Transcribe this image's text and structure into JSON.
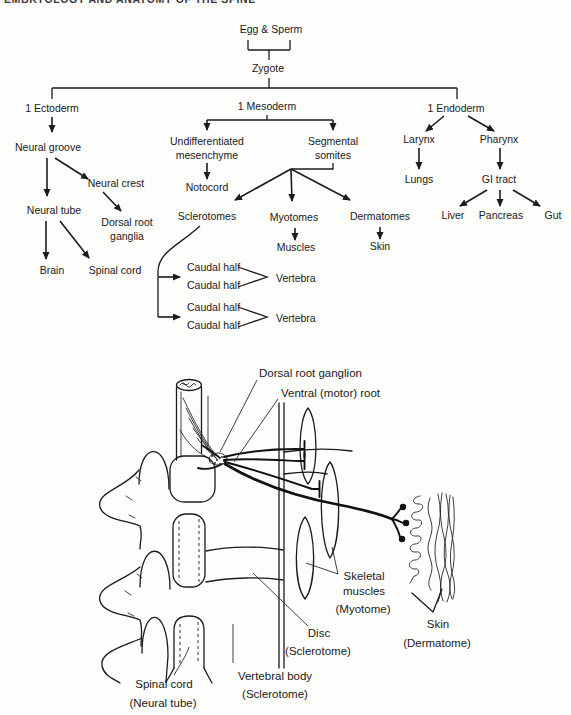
{
  "header": {
    "clipped_text": "EMBRYOLOGY AND ANATOMY OF THE SPINE"
  },
  "colors": {
    "ink": "#1c1c1c",
    "paper": "#fdfdfc"
  },
  "flowchart": {
    "egg_sperm": "Egg & Sperm",
    "zygote": "Zygote",
    "ectoderm": "1 Ectoderm",
    "neural_groove": "Neural groove",
    "neural_crest": "Neural crest",
    "neural_tube": "Neural tube",
    "dorsal_root_ganglia_line1": "Dorsal root",
    "dorsal_root_ganglia_line2": "ganglia",
    "brain": "Brain",
    "spinal_cord": "Spinal cord",
    "mesoderm": "1 Mesoderm",
    "undifferentiated_line1": "Undifferentiated",
    "undifferentiated_line2": "mesenchyme",
    "notocord": "Notocord",
    "segmental_line1": "Segmental",
    "segmental_line2": "somites",
    "sclerotomes": "Sclerotomes",
    "myotomes": "Myotomes",
    "dermatomes": "Dermatomes",
    "muscles": "Muscles",
    "skin": "Skin",
    "caudal_half": "Caudal half",
    "vertebra": "Vertebra",
    "endoderm": "1 Endoderm",
    "larynx": "Larynx",
    "pharynx": "Pharynx",
    "lungs": "Lungs",
    "gi_tract": "GI tract",
    "liver": "Liver",
    "pancreas": "Pancreas",
    "gut": "Gut"
  },
  "anatomy": {
    "dorsal_root_ganglion": "Dorsal root ganglion",
    "ventral_motor_root": "Ventral (motor) root",
    "skeletal_line1": "Skeletal",
    "skeletal_line2": "muscles",
    "skeletal_line3": "(Myotome)",
    "skin_line1": "Skin",
    "skin_line2": "(Dermatome)",
    "disc_line1": "Disc",
    "disc_line2": "(Sclerotome)",
    "vertebral_body_line1": "Vertebral body",
    "vertebral_body_line2": "(Sclerotome)",
    "spinal_cord_line1": "Spinal cord",
    "spinal_cord_line2": "(Neural tube)"
  }
}
